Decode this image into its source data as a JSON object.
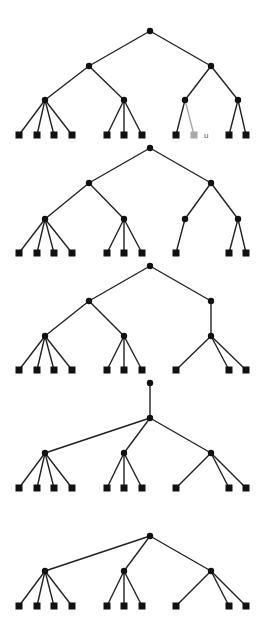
{
  "diagram": {
    "title": "",
    "colors": {
      "edge": "#222222",
      "node": "#111111",
      "highlight": "#a8a8a8",
      "label": "#555555"
    },
    "node_radius": 3.2,
    "leaf_size": 7,
    "trees": [
      {
        "id": "tree-1",
        "nodes": [
          {
            "id": "r",
            "x": 150,
            "y": 31,
            "type": "inner"
          },
          {
            "id": "a",
            "x": 89,
            "y": 66,
            "type": "inner"
          },
          {
            "id": "b",
            "x": 211,
            "y": 66,
            "type": "inner"
          },
          {
            "id": "c",
            "x": 45,
            "y": 100,
            "type": "inner"
          },
          {
            "id": "d",
            "x": 124,
            "y": 100,
            "type": "inner"
          },
          {
            "id": "e",
            "x": 185,
            "y": 100,
            "type": "inner"
          },
          {
            "id": "f",
            "x": 238,
            "y": 100,
            "type": "inner"
          },
          {
            "id": "l1",
            "x": 19,
            "y": 135,
            "type": "leaf"
          },
          {
            "id": "l2",
            "x": 37,
            "y": 135,
            "type": "leaf"
          },
          {
            "id": "l3",
            "x": 54,
            "y": 135,
            "type": "leaf"
          },
          {
            "id": "l4",
            "x": 72,
            "y": 135,
            "type": "leaf"
          },
          {
            "id": "l5",
            "x": 107,
            "y": 135,
            "type": "leaf"
          },
          {
            "id": "l6",
            "x": 124,
            "y": 135,
            "type": "leaf"
          },
          {
            "id": "l7",
            "x": 142,
            "y": 135,
            "type": "leaf"
          },
          {
            "id": "l8",
            "x": 176,
            "y": 135,
            "type": "leaf"
          },
          {
            "id": "u",
            "x": 194,
            "y": 135,
            "type": "leaf",
            "highlight": true,
            "label": "u"
          },
          {
            "id": "l10",
            "x": 229,
            "y": 135,
            "type": "leaf"
          },
          {
            "id": "l11",
            "x": 246,
            "y": 135,
            "type": "leaf"
          }
        ],
        "edges": [
          [
            "r",
            "a"
          ],
          [
            "r",
            "b"
          ],
          [
            "a",
            "c"
          ],
          [
            "a",
            "d"
          ],
          [
            "b",
            "e"
          ],
          [
            "b",
            "f"
          ],
          [
            "c",
            "l1"
          ],
          [
            "c",
            "l2"
          ],
          [
            "c",
            "l3"
          ],
          [
            "c",
            "l4"
          ],
          [
            "d",
            "l5"
          ],
          [
            "d",
            "l6"
          ],
          [
            "d",
            "l7"
          ],
          [
            "e",
            "l8"
          ],
          [
            "e",
            "u",
            true
          ],
          [
            "f",
            "l10"
          ],
          [
            "f",
            "l11"
          ]
        ]
      },
      {
        "id": "tree-2",
        "nodes": [
          {
            "id": "r",
            "x": 150,
            "y": 148,
            "type": "inner"
          },
          {
            "id": "a",
            "x": 89,
            "y": 183,
            "type": "inner"
          },
          {
            "id": "b",
            "x": 211,
            "y": 183,
            "type": "inner"
          },
          {
            "id": "c",
            "x": 45,
            "y": 219,
            "type": "inner"
          },
          {
            "id": "d",
            "x": 124,
            "y": 219,
            "type": "inner"
          },
          {
            "id": "e",
            "x": 185,
            "y": 219,
            "type": "inner"
          },
          {
            "id": "f",
            "x": 238,
            "y": 219,
            "type": "inner"
          },
          {
            "id": "l1",
            "x": 19,
            "y": 253,
            "type": "leaf"
          },
          {
            "id": "l2",
            "x": 37,
            "y": 253,
            "type": "leaf"
          },
          {
            "id": "l3",
            "x": 54,
            "y": 253,
            "type": "leaf"
          },
          {
            "id": "l4",
            "x": 72,
            "y": 253,
            "type": "leaf"
          },
          {
            "id": "l5",
            "x": 107,
            "y": 253,
            "type": "leaf"
          },
          {
            "id": "l6",
            "x": 124,
            "y": 253,
            "type": "leaf"
          },
          {
            "id": "l7",
            "x": 142,
            "y": 253,
            "type": "leaf"
          },
          {
            "id": "l8",
            "x": 176,
            "y": 253,
            "type": "leaf"
          },
          {
            "id": "l10",
            "x": 229,
            "y": 253,
            "type": "leaf"
          },
          {
            "id": "l11",
            "x": 246,
            "y": 253,
            "type": "leaf"
          }
        ],
        "edges": [
          [
            "r",
            "a"
          ],
          [
            "r",
            "b"
          ],
          [
            "a",
            "c"
          ],
          [
            "a",
            "d"
          ],
          [
            "b",
            "e"
          ],
          [
            "b",
            "f"
          ],
          [
            "c",
            "l1"
          ],
          [
            "c",
            "l2"
          ],
          [
            "c",
            "l3"
          ],
          [
            "c",
            "l4"
          ],
          [
            "d",
            "l5"
          ],
          [
            "d",
            "l6"
          ],
          [
            "d",
            "l7"
          ],
          [
            "e",
            "l8"
          ],
          [
            "f",
            "l10"
          ],
          [
            "f",
            "l11"
          ]
        ]
      },
      {
        "id": "tree-3",
        "nodes": [
          {
            "id": "r",
            "x": 150,
            "y": 266,
            "type": "inner"
          },
          {
            "id": "a",
            "x": 89,
            "y": 301,
            "type": "inner"
          },
          {
            "id": "b",
            "x": 211,
            "y": 301,
            "type": "inner"
          },
          {
            "id": "c",
            "x": 45,
            "y": 336,
            "type": "inner"
          },
          {
            "id": "d",
            "x": 124,
            "y": 336,
            "type": "inner"
          },
          {
            "id": "g",
            "x": 211,
            "y": 336,
            "type": "inner"
          },
          {
            "id": "l1",
            "x": 19,
            "y": 370,
            "type": "leaf"
          },
          {
            "id": "l2",
            "x": 37,
            "y": 370,
            "type": "leaf"
          },
          {
            "id": "l3",
            "x": 54,
            "y": 370,
            "type": "leaf"
          },
          {
            "id": "l4",
            "x": 72,
            "y": 370,
            "type": "leaf"
          },
          {
            "id": "l5",
            "x": 107,
            "y": 370,
            "type": "leaf"
          },
          {
            "id": "l6",
            "x": 124,
            "y": 370,
            "type": "leaf"
          },
          {
            "id": "l7",
            "x": 142,
            "y": 370,
            "type": "leaf"
          },
          {
            "id": "l8",
            "x": 176,
            "y": 370,
            "type": "leaf"
          },
          {
            "id": "l10",
            "x": 229,
            "y": 370,
            "type": "leaf"
          },
          {
            "id": "l11",
            "x": 246,
            "y": 370,
            "type": "leaf"
          }
        ],
        "edges": [
          [
            "r",
            "a"
          ],
          [
            "r",
            "b"
          ],
          [
            "a",
            "c"
          ],
          [
            "a",
            "d"
          ],
          [
            "b",
            "g"
          ],
          [
            "c",
            "l1"
          ],
          [
            "c",
            "l2"
          ],
          [
            "c",
            "l3"
          ],
          [
            "c",
            "l4"
          ],
          [
            "d",
            "l5"
          ],
          [
            "d",
            "l6"
          ],
          [
            "d",
            "l7"
          ],
          [
            "g",
            "l8"
          ],
          [
            "g",
            "l10"
          ],
          [
            "g",
            "l11"
          ]
        ]
      },
      {
        "id": "tree-4",
        "nodes": [
          {
            "id": "t",
            "x": 150,
            "y": 383,
            "type": "inner"
          },
          {
            "id": "r",
            "x": 150,
            "y": 418,
            "type": "inner"
          },
          {
            "id": "c",
            "x": 45,
            "y": 453,
            "type": "inner"
          },
          {
            "id": "d",
            "x": 124,
            "y": 453,
            "type": "inner"
          },
          {
            "id": "g",
            "x": 211,
            "y": 453,
            "type": "inner"
          },
          {
            "id": "l1",
            "x": 19,
            "y": 488,
            "type": "leaf"
          },
          {
            "id": "l2",
            "x": 37,
            "y": 488,
            "type": "leaf"
          },
          {
            "id": "l3",
            "x": 54,
            "y": 488,
            "type": "leaf"
          },
          {
            "id": "l4",
            "x": 72,
            "y": 488,
            "type": "leaf"
          },
          {
            "id": "l5",
            "x": 107,
            "y": 488,
            "type": "leaf"
          },
          {
            "id": "l6",
            "x": 124,
            "y": 488,
            "type": "leaf"
          },
          {
            "id": "l7",
            "x": 142,
            "y": 488,
            "type": "leaf"
          },
          {
            "id": "l8",
            "x": 176,
            "y": 488,
            "type": "leaf"
          },
          {
            "id": "l10",
            "x": 229,
            "y": 488,
            "type": "leaf"
          },
          {
            "id": "l11",
            "x": 246,
            "y": 488,
            "type": "leaf"
          }
        ],
        "edges": [
          [
            "t",
            "r"
          ],
          [
            "r",
            "c"
          ],
          [
            "r",
            "d"
          ],
          [
            "r",
            "g"
          ],
          [
            "c",
            "l1"
          ],
          [
            "c",
            "l2"
          ],
          [
            "c",
            "l3"
          ],
          [
            "c",
            "l4"
          ],
          [
            "d",
            "l5"
          ],
          [
            "d",
            "l6"
          ],
          [
            "d",
            "l7"
          ],
          [
            "g",
            "l8"
          ],
          [
            "g",
            "l10"
          ],
          [
            "g",
            "l11"
          ]
        ]
      },
      {
        "id": "tree-5",
        "nodes": [
          {
            "id": "r",
            "x": 150,
            "y": 536,
            "type": "inner"
          },
          {
            "id": "c",
            "x": 45,
            "y": 571,
            "type": "inner"
          },
          {
            "id": "d",
            "x": 124,
            "y": 571,
            "type": "inner"
          },
          {
            "id": "g",
            "x": 211,
            "y": 571,
            "type": "inner"
          },
          {
            "id": "l1",
            "x": 19,
            "y": 606,
            "type": "leaf"
          },
          {
            "id": "l2",
            "x": 37,
            "y": 606,
            "type": "leaf"
          },
          {
            "id": "l3",
            "x": 54,
            "y": 606,
            "type": "leaf"
          },
          {
            "id": "l4",
            "x": 72,
            "y": 606,
            "type": "leaf"
          },
          {
            "id": "l5",
            "x": 107,
            "y": 606,
            "type": "leaf"
          },
          {
            "id": "l6",
            "x": 124,
            "y": 606,
            "type": "leaf"
          },
          {
            "id": "l7",
            "x": 142,
            "y": 606,
            "type": "leaf"
          },
          {
            "id": "l8",
            "x": 176,
            "y": 606,
            "type": "leaf"
          },
          {
            "id": "l10",
            "x": 229,
            "y": 606,
            "type": "leaf"
          },
          {
            "id": "l11",
            "x": 246,
            "y": 606,
            "type": "leaf"
          }
        ],
        "edges": [
          [
            "r",
            "c"
          ],
          [
            "r",
            "d"
          ],
          [
            "r",
            "g"
          ],
          [
            "c",
            "l1"
          ],
          [
            "c",
            "l2"
          ],
          [
            "c",
            "l3"
          ],
          [
            "c",
            "l4"
          ],
          [
            "d",
            "l5"
          ],
          [
            "d",
            "l6"
          ],
          [
            "d",
            "l7"
          ],
          [
            "g",
            "l8"
          ],
          [
            "g",
            "l10"
          ],
          [
            "g",
            "l11"
          ]
        ]
      }
    ]
  }
}
